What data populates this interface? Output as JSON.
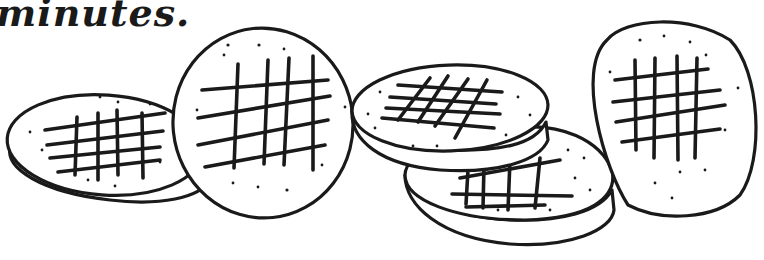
{
  "caption": {
    "text": "minutes."
  },
  "illustration": {
    "subject": "five cross-hatched round cookies",
    "cookie_count": 5,
    "stroke_color": "#1a1a1a",
    "background_color": "#ffffff"
  }
}
